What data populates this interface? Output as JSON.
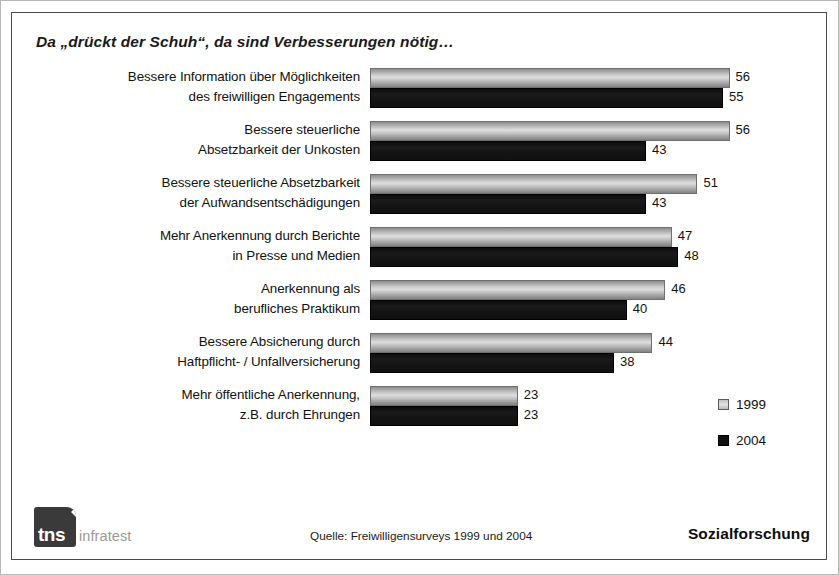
{
  "chart_data": {
    "type": "bar",
    "orientation": "horizontal",
    "title": "Da „drückt der Schuh“, da sind Verbesserungen nötig…",
    "xlabel": "",
    "ylabel": "",
    "grid": false,
    "xlim": [
      0,
      60
    ],
    "legend_position": "right-bottom",
    "categories": [
      "Bessere Information über Möglichkeiten des freiwilligen Engagements",
      "Bessere steuerliche Absetzbarkeit der Unkosten",
      "Bessere steuerliche Absetzbarkeit der Aufwandsentschädigungen",
      "Mehr Anerkennung durch Berichte in Presse und Medien",
      "Anerkennung als berufliches Praktikum",
      "Bessere Absicherung durch Haftpflicht- / Unfallversicherung",
      "Mehr öffentliche Anerkennung, z.B. durch Ehrungen"
    ],
    "category_lines": [
      [
        "Bessere Information über Möglichkeiten",
        "des freiwilligen Engagements"
      ],
      [
        "Bessere steuerliche",
        "Absetzbarkeit der Unkosten"
      ],
      [
        "Bessere steuerliche Absetzbarkeit",
        "der  Aufwandsentschädigungen"
      ],
      [
        "Mehr Anerkennung durch Berichte",
        "in Presse und Medien"
      ],
      [
        "Anerkennung als",
        "berufliches Praktikum"
      ],
      [
        "Bessere Absicherung durch",
        "Haftpflicht- / Unfallversicherung"
      ],
      [
        "Mehr öffentliche Anerkennung,",
        "z.B.  durch Ehrungen"
      ]
    ],
    "series": [
      {
        "name": "1999",
        "color": "#c9c9c9",
        "values": [
          56,
          56,
          51,
          47,
          46,
          44,
          23
        ]
      },
      {
        "name": "2004",
        "color": "#101010",
        "values": [
          55,
          43,
          43,
          48,
          40,
          38,
          23
        ]
      }
    ]
  },
  "legend": {
    "items": [
      {
        "label": "1999",
        "swatch": "light-gray-swatch"
      },
      {
        "label": "2004",
        "swatch": "black-swatch"
      }
    ]
  },
  "footer": {
    "logo_mark": "tns",
    "logo_word": "infratest",
    "source": "Quelle: Freiwilligensurveys 1999 und 2004",
    "brandline": "Sozialforschung"
  }
}
